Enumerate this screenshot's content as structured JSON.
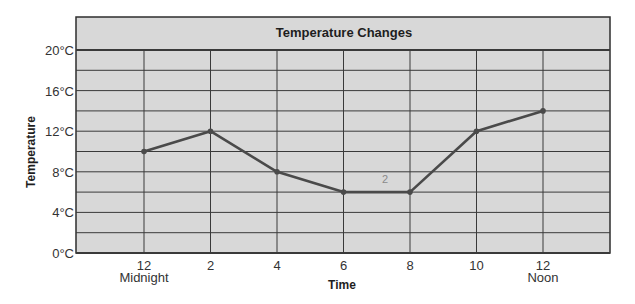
{
  "chart_data": {
    "type": "line",
    "title": "Temperature Changes",
    "xlabel": "Time",
    "ylabel": "Temperature",
    "categories": [
      "12",
      "2",
      "4",
      "6",
      "8",
      "10",
      "12"
    ],
    "category_sublabels": [
      "Midnight",
      "",
      "",
      "",
      "",
      "",
      "Noon"
    ],
    "series": [
      {
        "name": "Temperature",
        "values": [
          10,
          12,
          8,
          6,
          6,
          12,
          14
        ]
      }
    ],
    "ylim": [
      0,
      20
    ],
    "yticks": [
      0,
      4,
      8,
      12,
      16,
      20
    ],
    "ytick_labels": [
      "0°C",
      "4°C",
      "8°C",
      "12°C",
      "16°C",
      "20°C"
    ],
    "y_minor_grid_step": 2,
    "grid": true,
    "legend": null,
    "annotations": [
      {
        "text": "2",
        "note": "handwritten pencil mark",
        "x_between": [
          "6",
          "8"
        ],
        "y_approx": 7.3
      }
    ]
  },
  "colors": {
    "plot_background": "#d6d6d6",
    "title_band": "#d9d9d9",
    "grid": "#3a3a3a",
    "line": "#4a4a4a",
    "text": "#333333"
  }
}
